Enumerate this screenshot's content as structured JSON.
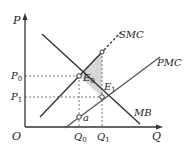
{
  "diagram": {
    "type": "economics-externality",
    "axes": {
      "y_label": "P",
      "x_label": "Q",
      "origin_label": "O"
    },
    "curves": {
      "smc": "SMC",
      "pmc": "PMC",
      "mb": "MB"
    },
    "points": {
      "e0": "E",
      "e0_sub": "0",
      "e1": "E",
      "e1_sub": "1",
      "a": "a"
    },
    "ticks": {
      "p0": "P",
      "p0_sub": "0",
      "p1": "P",
      "p1_sub": "1",
      "q0": "Q",
      "q0_sub": "0",
      "q1": "Q",
      "q1_sub": "1"
    },
    "colors": {
      "line": "#333333",
      "shade": "#d6d6d6",
      "dash": "#555555"
    }
  }
}
